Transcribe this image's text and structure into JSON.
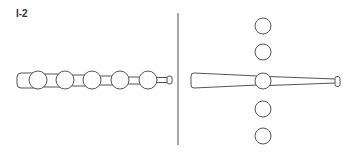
{
  "figure": {
    "label": "I-2",
    "left_panel": {
      "description": "bat with five balls threaded along its length",
      "ball_count": 5
    },
    "right_panel": {
      "description": "bat with one ball at center and two balls above and two below in a vertical column",
      "ball_count": 5
    },
    "stroke_color": "#555555"
  }
}
